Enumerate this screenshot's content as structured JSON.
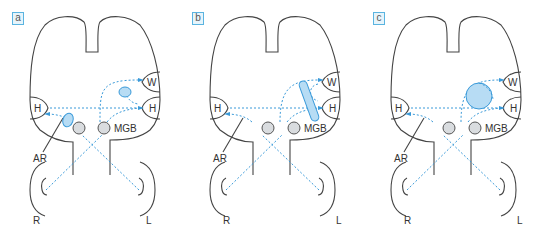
{
  "colors": {
    "outline": "#444444",
    "pathway": "#3a9ad9",
    "lesion_fill": "#b7dcf4",
    "lesion_stroke": "#3a9ad9",
    "nucleus_fill": "#d9dcdf",
    "nucleus_stroke": "#555555",
    "label_box": "#5ab4e0"
  },
  "panels": [
    {
      "id": "a",
      "label": "a",
      "lesion": "two small lesions: near AR (left) and between W and right H"
    },
    {
      "id": "b",
      "label": "b",
      "lesion": "elongated oblique lesion cutting pathways to W and right H"
    },
    {
      "id": "c",
      "label": "c",
      "lesion": "large round lesion anterior to W and right H"
    }
  ],
  "labels": {
    "wernicke": "W",
    "heschl": "H",
    "mgb": "MGB",
    "acoustic_radiation": "AR",
    "right_ear": "R",
    "left_ear": "L"
  }
}
